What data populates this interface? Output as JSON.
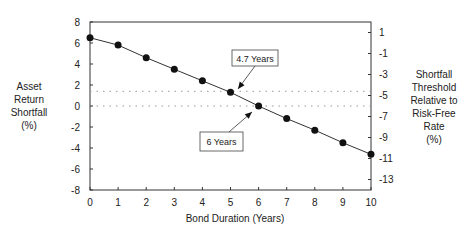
{
  "chart_data": {
    "type": "line",
    "title": "",
    "xlabel": "Bond Duration (Years)",
    "ylabel": "Asset Return Shortfall (%)",
    "ylabel_lines": [
      "Asset",
      "Return",
      "Shortfall",
      "(%)"
    ],
    "y2label": "Shortfall Threshold Relative to Risk-Free Rate (%)",
    "y2label_lines": [
      "Shortfall",
      "Threshold",
      "Relative to",
      "Risk-Free",
      "Rate",
      "(%)"
    ],
    "x": [
      0,
      1,
      2,
      3,
      4,
      5,
      6,
      7,
      8,
      9,
      10
    ],
    "series": [
      {
        "name": "Asset Return Shortfall",
        "values": [
          6.5,
          5.8,
          4.6,
          3.5,
          2.4,
          1.3,
          0.0,
          -1.2,
          -2.3,
          -3.5,
          -4.6
        ]
      }
    ],
    "xlim": [
      0,
      10
    ],
    "ylim": [
      -8,
      8
    ],
    "y2lim": [
      -14,
      2
    ],
    "x_ticks": [
      "0",
      "1",
      "2",
      "3",
      "4",
      "5",
      "6",
      "7",
      "8",
      "9",
      "10"
    ],
    "y_ticks": [
      "8",
      "6",
      "4",
      "2",
      "0",
      "-2",
      "-4",
      "-6",
      "-8"
    ],
    "y2_ticks": [
      "1",
      "-1",
      "-3",
      "-5",
      "-7",
      "-9",
      "-11",
      "-13"
    ],
    "reference_lines": [
      {
        "y": 1.4,
        "style": "dotted"
      },
      {
        "y": 0,
        "style": "dotted"
      }
    ],
    "annotations": [
      {
        "text": "4.7 Years",
        "target_x": 4.7,
        "target_y": 1.4
      },
      {
        "text": "6 Years",
        "target_x": 6,
        "target_y": 0
      }
    ],
    "grid": false,
    "legend": "none"
  }
}
